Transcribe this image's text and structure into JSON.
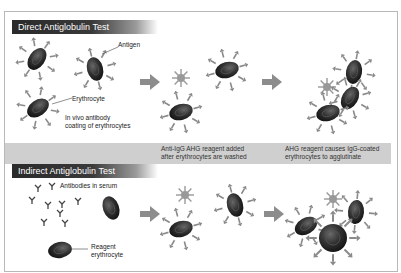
{
  "direct": {
    "title": "Direct Antiglobulin Test",
    "labels": {
      "antigen": "Antigen",
      "erythrocyte": "Erythrocyte",
      "in_vivo_1": "In vivo antibody",
      "in_vivo_2": "coating of erythrocytes"
    }
  },
  "steps": {
    "step1_line1": "Anti-IgG AHG reagent added",
    "step1_line2": "after erythrocytes are washed",
    "step2_line1": "AHG reagent causes IgG-coated",
    "step2_line2": "erythrocytes to agglutinate"
  },
  "indirect": {
    "title": "Indirect Antiglobulin Test",
    "labels": {
      "antibodies": "Antibodies in serum",
      "reagent_1": "Reagent",
      "reagent_2": "erythrocyte"
    }
  },
  "colors": {
    "header_bg": "#2a2a2a",
    "band_bg": "#cfcfcf",
    "cell": "#2b2b2b",
    "antibody": "#8a8a8a",
    "arrow": "#8c8c8c"
  }
}
